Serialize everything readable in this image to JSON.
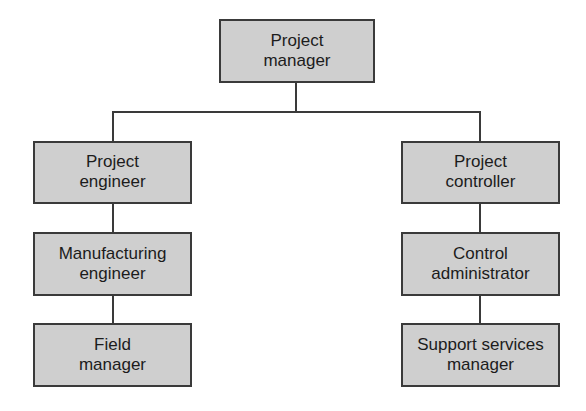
{
  "diagram": {
    "type": "org-chart",
    "colors": {
      "box_fill": "#cfcfcf",
      "box_border": "#3a3a3a",
      "line": "#3a3a3a",
      "text": "#1c1c1c",
      "background": "#ffffff"
    },
    "root": {
      "line1": "Project",
      "line2": "manager"
    },
    "left_branch": [
      {
        "line1": "Project",
        "line2": "engineer"
      },
      {
        "line1": "Manufacturing",
        "line2": "engineer"
      },
      {
        "line1": "Field",
        "line2": "manager"
      }
    ],
    "right_branch": [
      {
        "line1": "Project",
        "line2": "controller"
      },
      {
        "line1": "Control",
        "line2": "administrator"
      },
      {
        "line1": "Support services",
        "line2": "manager"
      }
    ],
    "edges": [
      {
        "from": "Project manager",
        "to": "Project engineer"
      },
      {
        "from": "Project manager",
        "to": "Project controller"
      },
      {
        "from": "Project engineer",
        "to": "Manufacturing engineer"
      },
      {
        "from": "Manufacturing engineer",
        "to": "Field manager"
      },
      {
        "from": "Project controller",
        "to": "Control administrator"
      },
      {
        "from": "Control administrator",
        "to": "Support services manager"
      }
    ]
  }
}
